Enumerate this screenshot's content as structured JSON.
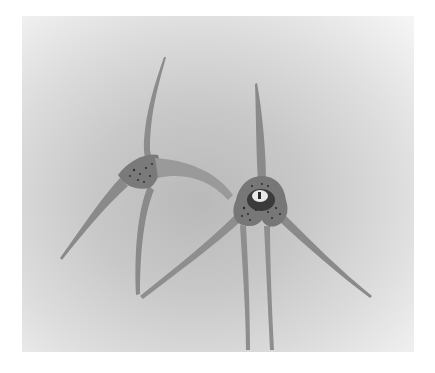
{
  "image": {
    "description": "Grayscale watercolor painting of two spider-like orchid flowers with long slender sepal tails on textured paper",
    "subjects": [
      "left orchid flower (side view)",
      "right orchid flower (front view)"
    ],
    "palette": {
      "paper_light": "#f4f4f4",
      "paper_dark": "#b5b5b5",
      "petal": "#8a8a8a",
      "petal_dark": "#5e5e5e",
      "spots": "#2a2a2a",
      "column": "#e8e8e8"
    }
  }
}
